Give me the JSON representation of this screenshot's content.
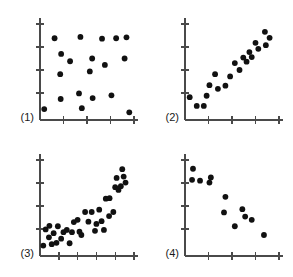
{
  "figure": {
    "width": 293,
    "height": 277,
    "background_color": "#ffffff",
    "dot_color": "#111111",
    "axis_color": "#4a4a4a",
    "label_color": "#1a1a1a",
    "dot_radius": 2.9,
    "panel_count": 4
  },
  "chart_data": [
    {
      "type": "scatter",
      "title": "(1)",
      "label": "(1)",
      "xlabel": "",
      "ylabel": "",
      "xlim": [
        0,
        10
      ],
      "ylim": [
        0,
        10
      ],
      "grid": false,
      "legend": "none",
      "x_ticks": [
        0,
        2.5,
        5,
        7.5,
        10
      ],
      "y_ticks": [
        0,
        2.5,
        5,
        7.5,
        10
      ],
      "description": "no association / random scatter",
      "points": [
        [
          0.45,
          0.75
        ],
        [
          1.55,
          8.45
        ],
        [
          2.25,
          6.75
        ],
        [
          2.15,
          4.55
        ],
        [
          2.2,
          1.85
        ],
        [
          3.2,
          5.95
        ],
        [
          4.3,
          8.6
        ],
        [
          4.15,
          2.45
        ],
        [
          4.45,
          0.85
        ],
        [
          5.55,
          6.25
        ],
        [
          5.3,
          4.85
        ],
        [
          5.6,
          1.95
        ],
        [
          6.6,
          8.4
        ],
        [
          6.9,
          5.55
        ],
        [
          7.6,
          2.25
        ],
        [
          8.1,
          8.45
        ],
        [
          9.0,
          6.25
        ],
        [
          9.2,
          8.55
        ],
        [
          9.5,
          0.4
        ]
      ]
    },
    {
      "type": "scatter",
      "title": "(2)",
      "label": "(2)",
      "xlabel": "",
      "ylabel": "",
      "xlim": [
        0,
        10
      ],
      "ylim": [
        0,
        10
      ],
      "grid": false,
      "legend": "none",
      "x_ticks": [
        0,
        2.5,
        5,
        7.5,
        10
      ],
      "y_ticks": [
        0,
        2.5,
        5,
        7.5,
        10
      ],
      "description": "positive curvilinear association",
      "points": [
        [
          0.5,
          2.05
        ],
        [
          1.25,
          1.1
        ],
        [
          2.0,
          1.1
        ],
        [
          2.3,
          2.2
        ],
        [
          2.6,
          3.35
        ],
        [
          3.2,
          4.55
        ],
        [
          3.5,
          2.95
        ],
        [
          4.3,
          3.3
        ],
        [
          4.8,
          4.3
        ],
        [
          5.3,
          5.75
        ],
        [
          5.8,
          5.0
        ],
        [
          6.2,
          6.35
        ],
        [
          6.55,
          5.9
        ],
        [
          6.85,
          6.95
        ],
        [
          7.1,
          6.4
        ],
        [
          7.5,
          7.95
        ],
        [
          7.8,
          7.3
        ],
        [
          8.6,
          7.7
        ],
        [
          8.5,
          9.15
        ],
        [
          9.0,
          8.5
        ]
      ]
    },
    {
      "type": "scatter",
      "title": "(3)",
      "label": "(3)",
      "xlabel": "",
      "ylabel": "",
      "xlim": [
        0,
        10
      ],
      "ylim": [
        0,
        10
      ],
      "grid": false,
      "legend": "none",
      "x_ticks": [
        0,
        2,
        4,
        6,
        8,
        10
      ],
      "y_ticks": [
        0,
        2.5,
        5,
        7.5,
        10
      ],
      "description": "exponential-like rising association with scatter",
      "points": [
        [
          0.35,
          0.7
        ],
        [
          0.6,
          2.45
        ],
        [
          0.95,
          1.6
        ],
        [
          1.0,
          2.85
        ],
        [
          1.25,
          0.85
        ],
        [
          1.45,
          2.05
        ],
        [
          1.75,
          1.0
        ],
        [
          1.9,
          2.8
        ],
        [
          2.25,
          1.45
        ],
        [
          2.5,
          2.15
        ],
        [
          2.85,
          2.4
        ],
        [
          3.15,
          0.95
        ],
        [
          3.4,
          2.15
        ],
        [
          3.6,
          3.25
        ],
        [
          4.0,
          3.5
        ],
        [
          4.2,
          2.2
        ],
        [
          4.4,
          1.85
        ],
        [
          4.8,
          4.35
        ],
        [
          5.15,
          3.3
        ],
        [
          5.5,
          4.35
        ],
        [
          5.85,
          2.3
        ],
        [
          6.0,
          3.05
        ],
        [
          6.3,
          4.6
        ],
        [
          6.55,
          3.35
        ],
        [
          6.8,
          2.4
        ],
        [
          7.0,
          5.8
        ],
        [
          7.4,
          5.85
        ],
        [
          7.35,
          3.9
        ],
        [
          7.8,
          4.35
        ],
        [
          8.0,
          7.05
        ],
        [
          8.15,
          8.05
        ],
        [
          8.35,
          6.75
        ],
        [
          8.6,
          7.15
        ],
        [
          8.75,
          9.0
        ],
        [
          8.9,
          8.2
        ],
        [
          9.1,
          7.55
        ]
      ]
    },
    {
      "type": "scatter",
      "title": "(4)",
      "label": "(4)",
      "xlabel": "",
      "ylabel": "",
      "xlim": [
        0,
        10
      ],
      "ylim": [
        0,
        10
      ],
      "grid": false,
      "legend": "none",
      "x_ticks": [
        0,
        2.5,
        5,
        7.5,
        10
      ],
      "y_ticks": [
        0,
        2.5,
        5,
        7.5,
        10
      ],
      "description": "negative association, decreasing trend",
      "points": [
        [
          0.85,
          9.05
        ],
        [
          0.75,
          7.85
        ],
        [
          1.6,
          7.75
        ],
        [
          2.6,
          7.55
        ],
        [
          2.75,
          8.1
        ],
        [
          4.3,
          6.0
        ],
        [
          4.15,
          4.3
        ],
        [
          5.3,
          2.8
        ],
        [
          6.1,
          4.65
        ],
        [
          6.4,
          3.85
        ],
        [
          7.1,
          3.5
        ],
        [
          8.4,
          1.85
        ]
      ]
    }
  ]
}
